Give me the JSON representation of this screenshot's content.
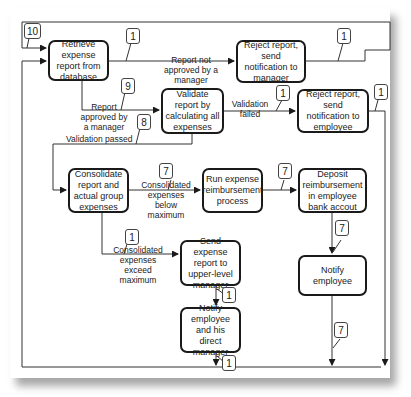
{
  "diagram": {
    "nodes": [
      {
        "id": "retrieve",
        "label": "Retrieve expense report from database"
      },
      {
        "id": "reject_manager",
        "label": "Reject report, send notification to manager"
      },
      {
        "id": "validate",
        "label": "Validate report by calculating all expenses"
      },
      {
        "id": "reject_employee",
        "label": "Reject report, send notification to employee"
      },
      {
        "id": "consolidate",
        "label": "Consolidate report and actual group expenses"
      },
      {
        "id": "run",
        "label": "Run expense reimbursement process"
      },
      {
        "id": "deposit",
        "label": "Deposit reimbursement in employee bank accout"
      },
      {
        "id": "send_upper",
        "label": "Send expense report to upper-level manager"
      },
      {
        "id": "notify_employee",
        "label": "Notify employee"
      },
      {
        "id": "notify_both",
        "label": "Notify employee and his direct manager"
      }
    ],
    "edge_labels": {
      "not_approved": "Report not approved by a manager",
      "approved": "Report approved by a manager",
      "validation_failed": "Validation failed",
      "validation_passed": "Validation passed",
      "below_max": "Consolidated expenses below maximum",
      "exceed_max": "Consolidated expenses exceed maximum"
    },
    "callouts": {
      "loop": "10",
      "not_approved": "1",
      "reject_manager_out": "1",
      "approved": "9",
      "validation_failed": "1",
      "reject_employee_out": "1",
      "validation_passed": "8",
      "below_max": "7",
      "run_to_deposit": "7",
      "deposit_to_notify": "7",
      "exceed_max": "1",
      "send_to_notify": "1",
      "notify_both_out": "1",
      "notify_employee_out": "7"
    }
  }
}
